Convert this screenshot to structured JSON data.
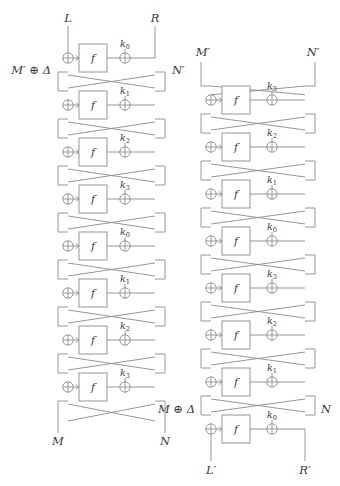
{
  "figure": {
    "background_color": "#ffffff",
    "line_color": "#8a8a8a",
    "text_color": "#3a3a3a",
    "function_box_label": "f",
    "xor_symbol": "⊕",
    "rounds_per_column": 8
  },
  "left_column": {
    "name": "encryption-network",
    "top_labels": {
      "left": "L",
      "right": "R"
    },
    "bottom_labels": {
      "left": "M",
      "right": "N"
    },
    "intermediate_labels": {
      "left": "M′ ⊕ Δ",
      "right": "N′"
    },
    "keys": [
      {
        "base": "k",
        "sub": "0"
      },
      {
        "base": "k",
        "sub": "1"
      },
      {
        "base": "k",
        "sub": "2"
      },
      {
        "base": "k",
        "sub": "3"
      },
      {
        "base": "k",
        "sub": "0"
      },
      {
        "base": "k",
        "sub": "1"
      },
      {
        "base": "k",
        "sub": "2"
      },
      {
        "base": "k",
        "sub": "3"
      }
    ]
  },
  "right_column": {
    "name": "decryption-network",
    "top_labels": {
      "left": "M′",
      "right": "N′"
    },
    "bottom_labels": {
      "left": "L′",
      "right": "R′"
    },
    "intermediate_labels": {
      "left": "M ⊕ Δ",
      "right": "N"
    },
    "keys": [
      {
        "base": "k",
        "sub": "3"
      },
      {
        "base": "k",
        "sub": "2"
      },
      {
        "base": "k",
        "sub": "1"
      },
      {
        "base": "k",
        "sub": "0"
      },
      {
        "base": "k",
        "sub": "3"
      },
      {
        "base": "k",
        "sub": "2"
      },
      {
        "base": "k",
        "sub": "1"
      },
      {
        "base": "k",
        "sub": "0"
      }
    ]
  }
}
